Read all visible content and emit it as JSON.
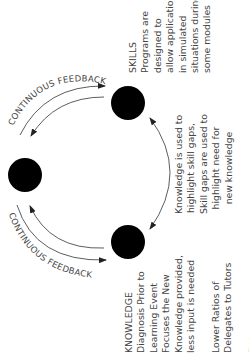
{
  "diagram": {
    "nodes": [
      {
        "id": "skills",
        "cx": 128,
        "cy": 103,
        "r": 17
      },
      {
        "id": "left",
        "cx": 25,
        "cy": 175,
        "r": 17
      },
      {
        "id": "knowledge",
        "cx": 128,
        "cy": 242,
        "r": 17
      }
    ],
    "feedback_label_top": "CONTINUOUS FEEDBACK",
    "feedback_label_bottom": "CONTINUOUS FEEDBACK",
    "skills": {
      "title": "SKILLS",
      "lines": [
        "Programs are",
        "designed to",
        "allow application",
        "in simulated",
        "situations during",
        "some modules"
      ]
    },
    "link": {
      "lines": [
        "Knowledge is used to",
        "highlight skill gaps,",
        "Skill gaps are used to",
        "highlight need for",
        "new knowledge"
      ]
    },
    "knowledge": {
      "title": "KNOWLEDGE",
      "lines": [
        "Diagnosis Prior to",
        "Learning Event",
        "Focuses the New",
        "Knowledge provided,",
        "less input is needed"
      ],
      "para2": [
        "Lower Ratios of",
        "Delegates to Tutors"
      ],
      "para3": [
        "Delegates are"
      ]
    },
    "colors": {
      "node": "#000000",
      "line": "#333333",
      "text": "#444444"
    }
  }
}
